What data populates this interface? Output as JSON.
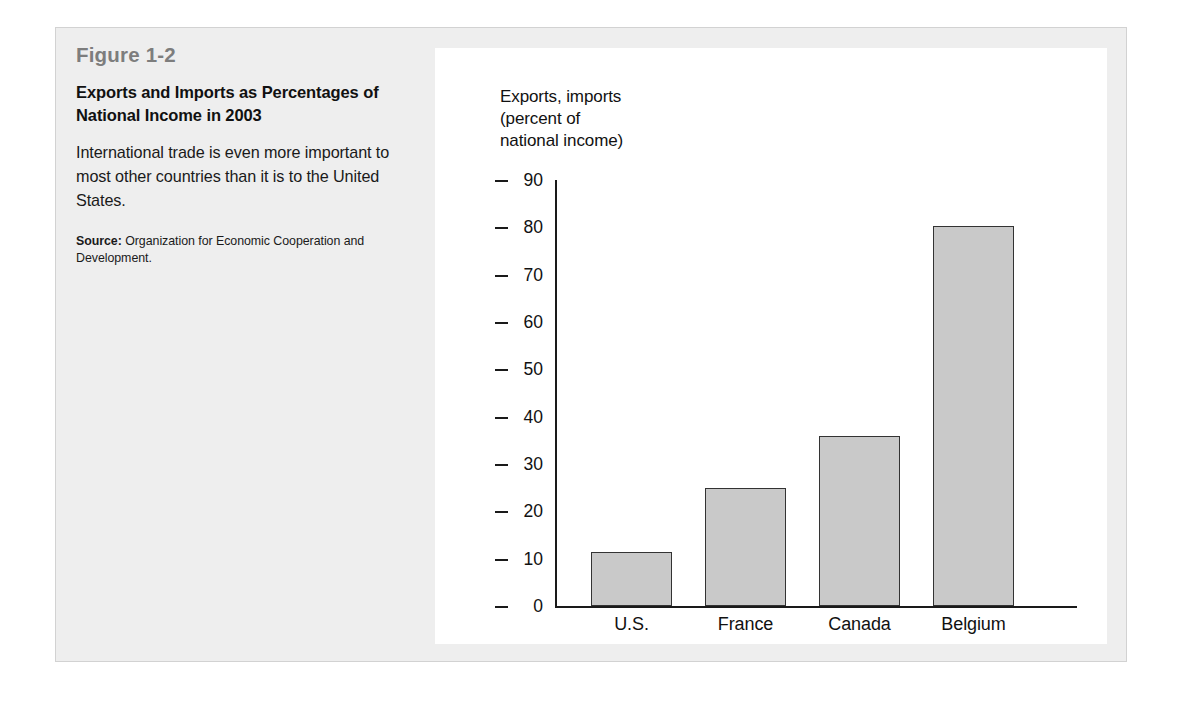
{
  "figure": {
    "number": "Figure 1-2",
    "title": "Exports and Imports as Percentages of National Income in 2003",
    "description": "International trade is even more important to most other countries than it is to the United States.",
    "source_label": "Source:",
    "source_text": " Organization for Economic Cooperation and Development."
  },
  "colors": {
    "panel_background": "#eeeeee",
    "chart_background": "#ffffff",
    "bar_fill": "#c9c9c9",
    "bar_stroke": "#333333",
    "axis": "#1a1a1a",
    "figure_number": "#7d7d7d",
    "text": "#111111"
  },
  "chart_data": {
    "type": "bar",
    "title": "",
    "ylabel": "Exports, imports\n(percent of\nnational income)",
    "xlabel": "",
    "categories": [
      "U.S.",
      "France",
      "Canada",
      "Belgium"
    ],
    "values": [
      11.5,
      25,
      36,
      80.3
    ],
    "ylim": [
      0,
      90
    ],
    "yticks": [
      0,
      10,
      20,
      30,
      40,
      50,
      60,
      70,
      80,
      90
    ],
    "ytick_labels": [
      "0",
      "10",
      "20",
      "30",
      "40",
      "50",
      "60",
      "70",
      "80",
      "90"
    ],
    "grid": false,
    "legend": null,
    "series": [
      {
        "name": "Exports and imports as percent of national income, 2003",
        "values": [
          11.5,
          25,
          36,
          80.3
        ]
      }
    ]
  }
}
